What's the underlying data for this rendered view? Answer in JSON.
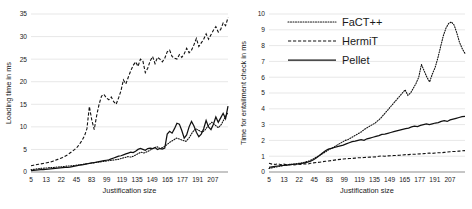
{
  "figure": {
    "panels": [
      "loading-time",
      "entailment-time"
    ]
  },
  "legend": {
    "position": "top-left-of-right-panel",
    "entries": [
      {
        "label": "FaCT++",
        "style": "dotted",
        "color": "#111111"
      },
      {
        "label": "HermiT",
        "style": "dashed",
        "color": "#111111"
      },
      {
        "label": "Pellet",
        "style": "solid",
        "color": "#111111"
      }
    ]
  },
  "chart_data": [
    {
      "type": "line",
      "id": "loading-time",
      "title": "",
      "xlabel": "Justification size",
      "ylabel": "Loading time in ms",
      "xlim": [
        0,
        52
      ],
      "ylim": [
        0,
        35
      ],
      "grid": true,
      "legend_position": "none",
      "yticks": [
        0,
        5,
        10,
        15,
        20,
        25,
        30,
        35
      ],
      "xtick_labels": [
        "5",
        "13",
        "22",
        "45",
        "83",
        "99",
        "119",
        "135",
        "149",
        "165",
        "177",
        "191",
        "207"
      ],
      "xtick_index": [
        0,
        4,
        8,
        12,
        16,
        20,
        24,
        28,
        32,
        36,
        40,
        44,
        48
      ],
      "series": [
        {
          "name": "FaCT++",
          "style": "dotted",
          "values": [
            0.5,
            0.6,
            0.7,
            0.8,
            0.85,
            0.9,
            1.0,
            1.0,
            1.1,
            1.15,
            1.2,
            1.3,
            1.35,
            1.4,
            1.5,
            1.6,
            1.7,
            1.8,
            1.9,
            2.0,
            2.1,
            2.2,
            2.3,
            2.4,
            2.5,
            2.6,
            2.7,
            2.8,
            3.0,
            3.2,
            3.4,
            3.3,
            3.6,
            4.0,
            4.4,
            4.2,
            4.5,
            4.9,
            5.3,
            5.6,
            5.2,
            5.5,
            6.0,
            6.6,
            7.0,
            7.5,
            7.3,
            7.0,
            6.8,
            7.6,
            8.8,
            9.6,
            9.2,
            8.8,
            9.4,
            10.4,
            11.0,
            10.4,
            9.8,
            10.6,
            12.0,
            13.2
          ]
        },
        {
          "name": "HermiT",
          "style": "dashed",
          "values": [
            1.4,
            1.5,
            1.6,
            1.7,
            1.8,
            1.9,
            2.0,
            2.1,
            2.2,
            2.4,
            2.6,
            2.8,
            3.0,
            3.2,
            3.5,
            3.8,
            4.2,
            4.6,
            5.0,
            5.5,
            6.2,
            7.0,
            8.0,
            9.6,
            14.5,
            11.5,
            9.4,
            12.5,
            15.0,
            16.8,
            17.2,
            16.4,
            16.0,
            16.6,
            15.6,
            15.0,
            16.4,
            18.0,
            20.4,
            19.5,
            21.0,
            22.4,
            23.6,
            24.4,
            23.4,
            25.0,
            24.6,
            22.0,
            23.0,
            24.6,
            25.6,
            24.0,
            25.4,
            25.0,
            24.4,
            25.2,
            26.6,
            27.0,
            25.6,
            25.2,
            25.0,
            26.0,
            25.4,
            26.2,
            27.4,
            26.4,
            27.0,
            28.2,
            29.6,
            27.8,
            28.6,
            29.4,
            30.6,
            29.4,
            30.4,
            31.4,
            32.2,
            31.0,
            31.6,
            33.0,
            32.4,
            34.2
          ]
        },
        {
          "name": "Pellet",
          "style": "solid",
          "values": [
            0.3,
            0.35,
            0.4,
            0.45,
            0.5,
            0.55,
            0.6,
            0.65,
            0.7,
            0.75,
            0.8,
            0.85,
            0.9,
            0.95,
            1.0,
            1.05,
            1.1,
            1.2,
            1.3,
            1.4,
            1.5,
            1.6,
            1.7,
            1.8,
            1.9,
            2.0,
            2.1,
            2.2,
            2.3,
            2.4,
            2.5,
            2.6,
            2.7,
            2.9,
            3.1,
            3.3,
            3.5,
            3.6,
            3.8,
            4.0,
            4.2,
            4.4,
            4.3,
            4.6,
            5.0,
            5.2,
            5.0,
            4.8,
            5.2,
            5.3,
            5.2,
            5.4,
            5.0,
            5.2,
            5.1,
            5.3,
            8.4,
            9.0,
            8.6,
            9.6,
            10.8,
            10.6,
            9.2,
            7.5,
            8.2,
            10.0,
            11.2,
            10.2,
            8.8,
            7.8,
            8.4,
            9.6,
            11.4,
            10.0,
            9.4,
            10.6,
            12.2,
            11.0,
            12.0,
            13.0,
            11.8,
            14.6
          ]
        }
      ]
    },
    {
      "type": "line",
      "id": "entailment-time",
      "title": "",
      "xlabel": "Justification size",
      "ylabel": "Time for entailment check in ms",
      "xlim": [
        0,
        52
      ],
      "ylim": [
        0,
        10
      ],
      "grid": true,
      "legend_position": "upper-left",
      "yticks": [
        0,
        1,
        2,
        3,
        4,
        5,
        6,
        7,
        8,
        9,
        10
      ],
      "xtick_labels": [
        "5",
        "13",
        "22",
        "45",
        "83",
        "99",
        "119",
        "135",
        "149",
        "165",
        "177",
        "191",
        "207"
      ],
      "xtick_index": [
        0,
        4,
        8,
        12,
        16,
        20,
        24,
        28,
        32,
        36,
        40,
        44,
        48
      ],
      "series": [
        {
          "name": "FaCT++",
          "style": "dotted",
          "values": [
            0.22,
            0.26,
            0.3,
            0.33,
            0.36,
            0.4,
            0.42,
            0.45,
            0.48,
            0.5,
            0.52,
            0.55,
            0.58,
            0.62,
            0.66,
            0.72,
            0.8,
            0.9,
            1.0,
            1.1,
            1.2,
            1.3,
            1.42,
            1.5,
            1.6,
            1.7,
            1.8,
            1.9,
            2.0,
            2.05,
            2.15,
            2.25,
            2.35,
            2.45,
            2.55,
            2.7,
            2.8,
            2.9,
            3.0,
            3.1,
            3.25,
            3.4,
            3.6,
            3.8,
            4.0,
            4.2,
            4.4,
            4.6,
            4.8,
            5.0,
            5.2,
            4.85,
            5.0,
            5.3,
            5.6,
            6.0,
            6.8,
            6.4,
            6.0,
            5.7,
            6.2,
            6.6,
            7.2,
            7.9,
            8.6,
            9.1,
            9.4,
            9.5,
            9.3,
            8.8,
            8.2,
            7.8,
            7.5
          ]
        },
        {
          "name": "HermiT",
          "style": "dashed",
          "values": [
            0.55,
            0.5,
            0.48,
            0.52,
            0.46,
            0.5,
            0.45,
            0.48,
            0.44,
            0.46,
            0.5,
            0.48,
            0.52,
            0.5,
            0.55,
            0.58,
            0.6,
            0.62,
            0.65,
            0.68,
            0.7,
            0.72,
            0.75,
            0.78,
            0.8,
            0.82,
            0.84,
            0.85,
            0.86,
            0.88,
            0.9,
            0.9,
            0.92,
            0.93,
            0.94,
            0.95,
            0.96,
            1.0,
            1.02,
            1.0,
            1.02,
            1.03,
            1.04,
            1.05,
            1.06,
            1.08,
            1.1,
            1.1,
            1.12,
            1.12,
            1.14,
            1.15,
            1.16,
            1.18,
            1.2,
            1.18,
            1.2,
            1.22,
            1.22,
            1.24,
            1.26,
            1.28,
            1.3,
            1.3,
            1.32,
            1.34,
            1.35
          ]
        },
        {
          "name": "Pellet",
          "style": "solid",
          "values": [
            0.3,
            0.33,
            0.36,
            0.38,
            0.4,
            0.42,
            0.44,
            0.46,
            0.48,
            0.5,
            0.52,
            0.55,
            0.58,
            0.62,
            0.68,
            0.78,
            0.9,
            1.05,
            1.2,
            1.35,
            1.45,
            1.5,
            1.55,
            1.6,
            1.65,
            1.7,
            1.78,
            1.85,
            1.92,
            1.95,
            2.0,
            2.05,
            2.0,
            2.1,
            2.15,
            2.2,
            2.25,
            2.3,
            2.38,
            2.4,
            2.45,
            2.5,
            2.55,
            2.6,
            2.65,
            2.7,
            2.75,
            2.78,
            2.85,
            2.9,
            2.88,
            2.95,
            3.0,
            3.05,
            3.0,
            3.05,
            3.1,
            3.12,
            3.2,
            3.25,
            3.2,
            3.3,
            3.35,
            3.4,
            3.45,
            3.5,
            3.52
          ]
        }
      ]
    }
  ]
}
